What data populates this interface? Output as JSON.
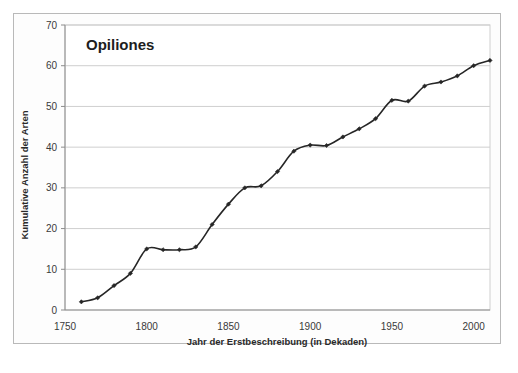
{
  "chart_data": {
    "type": "line",
    "title": "Opiliones",
    "xlabel": "Jahr der Erstbeschreibung (in Dekaden)",
    "ylabel": "Kumulative Anzahl der Arten",
    "xlim": [
      1750,
      2010
    ],
    "ylim": [
      0,
      70
    ],
    "xticks": [
      1750,
      1800,
      1850,
      1900,
      1950,
      2000
    ],
    "xtick_labels": [
      "1750",
      "1800",
      "1850",
      "1900",
      "1950",
      "2000"
    ],
    "yticks": [
      0,
      10,
      20,
      30,
      40,
      50,
      60,
      70
    ],
    "ytick_labels": [
      "0",
      "10",
      "20",
      "30",
      "40",
      "50",
      "60",
      "70"
    ],
    "grid": "horizontal",
    "legend": "none",
    "series": [
      {
        "name": "Kumulative Anzahl der Arten",
        "color": "#262626",
        "marker": "diamond",
        "x": [
          1760,
          1770,
          1780,
          1790,
          1800,
          1810,
          1820,
          1830,
          1840,
          1850,
          1860,
          1870,
          1880,
          1890,
          1900,
          1910,
          1920,
          1930,
          1940,
          1950,
          1960,
          1970,
          1980,
          1990,
          2000,
          2010
        ],
        "values": [
          2,
          3,
          6,
          9,
          15,
          14.8,
          14.8,
          15.5,
          21,
          26,
          30,
          30.5,
          34,
          39,
          40.5,
          40.4,
          42.5,
          44.5,
          47,
          51.5,
          51.3,
          55,
          56,
          57.5,
          60,
          61.3
        ]
      }
    ]
  },
  "colors": {
    "line": "#262626",
    "grid": "#cfcfcf",
    "axis": "#8c8c8c",
    "frame": "#b9b9b9",
    "text": "#3a3a3a"
  }
}
